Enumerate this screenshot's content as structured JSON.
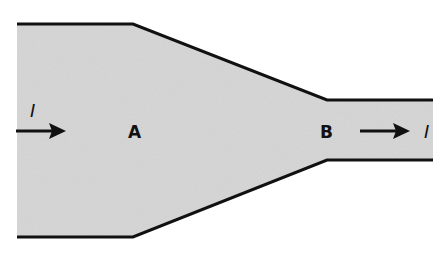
{
  "diagram": {
    "fill_color": "#d0d0d0",
    "edge_color": "#111111",
    "labels": {
      "point_a": "A",
      "point_b": "B",
      "current_in": "I",
      "current_out": "I"
    }
  }
}
